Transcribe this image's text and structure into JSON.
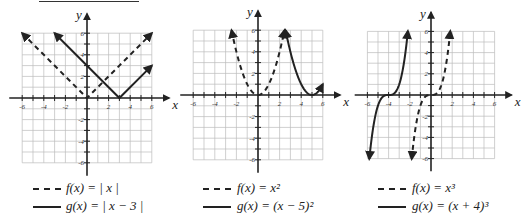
{
  "chart_data": [
    {
      "type": "line",
      "title": "",
      "xlabel": "x",
      "ylabel": "y",
      "xlim": [
        -6,
        6
      ],
      "ylim": [
        -6,
        6
      ],
      "xticks": [
        "-6",
        "-4",
        "-2",
        "2",
        "4",
        "6"
      ],
      "yticks": [
        "6",
        "4",
        "2",
        "-2",
        "-4",
        "-6"
      ],
      "grid": true,
      "series": [
        {
          "name": "f(x) = |x|",
          "style": "dashed",
          "points": [
            [
              -6,
              6
            ],
            [
              0,
              0
            ],
            [
              6,
              6
            ]
          ]
        },
        {
          "name": "g(x) = |x−3|",
          "style": "solid",
          "points": [
            [
              -3,
              6
            ],
            [
              3,
              0
            ],
            [
              6,
              3
            ]
          ]
        }
      ]
    },
    {
      "type": "line",
      "title": "",
      "xlabel": "x",
      "ylabel": "y",
      "xlim": [
        -6,
        6
      ],
      "ylim": [
        -6,
        6
      ],
      "xticks": [
        "-6",
        "-4",
        "-2",
        "2",
        "4",
        "6"
      ],
      "yticks": [
        "6",
        "4",
        "2",
        "-2",
        "-4",
        "-6"
      ],
      "grid": true,
      "series": [
        {
          "name": "f(x) = x²",
          "style": "dashed",
          "domain": [
            -2.45,
            2.45
          ]
        },
        {
          "name": "g(x) = (x−5)²",
          "style": "solid",
          "domain": [
            2.55,
            6
          ]
        }
      ]
    },
    {
      "type": "line",
      "title": "",
      "xlabel": "x",
      "ylabel": "y",
      "xlim": [
        -6,
        6
      ],
      "ylim": [
        -6,
        6
      ],
      "xticks": [
        "-6",
        "-4",
        "-2",
        "2",
        "4",
        "6"
      ],
      "yticks": [
        "6",
        "4",
        "2",
        "-2",
        "-4",
        "-6"
      ],
      "grid": true,
      "series": [
        {
          "name": "f(x) = x³",
          "style": "dashed",
          "domain": [
            -1.82,
            1.82
          ]
        },
        {
          "name": "g(x) = (x+4)³",
          "style": "solid",
          "domain": [
            -5.82,
            -2.18
          ]
        }
      ]
    }
  ],
  "legends": [
    {
      "f": "f(x) = | x |",
      "g": "g(x) = | x − 3 |"
    },
    {
      "f": "f(x) = x²",
      "g": "g(x) = (x − 5)²"
    },
    {
      "f": "f(x) = x³",
      "g": "g(x) = (x + 4)³"
    }
  ],
  "axis_labels": {
    "x": "x",
    "y": "y"
  }
}
